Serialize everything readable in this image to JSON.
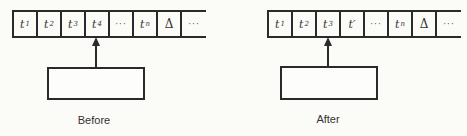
{
  "diagram": {
    "type": "turing-machine-tape-transition",
    "panels": [
      {
        "id": "before",
        "caption": "Before",
        "head_position_index": 3,
        "cells": [
          {
            "symbol": "t",
            "sub": "1"
          },
          {
            "symbol": "t",
            "sub": "2"
          },
          {
            "symbol": "t",
            "sub": "3"
          },
          {
            "symbol": "t",
            "sub": "4"
          },
          {
            "symbol": "···",
            "sub": ""
          },
          {
            "symbol": "t",
            "sub": "n"
          },
          {
            "symbol": "Δ",
            "sub": ""
          },
          {
            "symbol": "···",
            "sub": ""
          }
        ]
      },
      {
        "id": "after",
        "caption": "After",
        "head_position_index": 2,
        "cells": [
          {
            "symbol": "t",
            "sub": "1"
          },
          {
            "symbol": "t",
            "sub": "2"
          },
          {
            "symbol": "t",
            "sub": "3"
          },
          {
            "symbol": "t′",
            "sub": ""
          },
          {
            "symbol": "···",
            "sub": ""
          },
          {
            "symbol": "t",
            "sub": "n"
          },
          {
            "symbol": "Δ",
            "sub": ""
          },
          {
            "symbol": "···",
            "sub": ""
          }
        ]
      }
    ],
    "colors": {
      "line": "#2a2a2a",
      "background": "#fbfbf8",
      "text": "#333333"
    }
  }
}
